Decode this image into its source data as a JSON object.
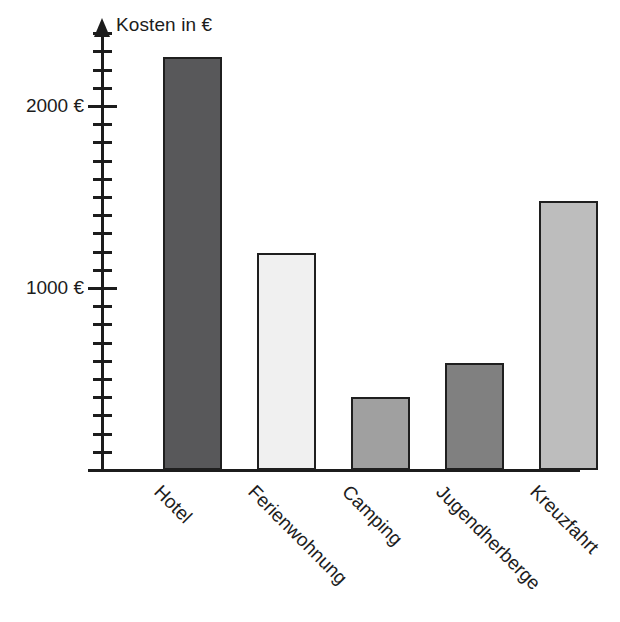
{
  "chart_data": {
    "type": "bar",
    "title": "",
    "ylabel": "Kosten in €",
    "xlabel": "",
    "categories": [
      "Hotel",
      "Ferienwohnung",
      "Camping",
      "Jugendherberge",
      "Kreuzfahrt"
    ],
    "values": [
      2270,
      1190,
      400,
      590,
      1480
    ],
    "unit": "€",
    "ylim": [
      0,
      2400
    ],
    "y_major_ticks": [
      1000,
      2000
    ],
    "y_major_tick_labels": [
      "1000 €",
      "2000 €"
    ],
    "y_minor_tick_interval": 100,
    "grid": false,
    "legend": null,
    "bar_colors": [
      "#58585a",
      "#f0f0f0",
      "#a0a0a0",
      "#808080",
      "#bdbdbd"
    ],
    "bar_border_color": "#1f1f1f",
    "axis_color": "#1c1c1c",
    "category_label_rotation_deg": 45,
    "series": [
      {
        "name": "Kosten",
        "points": [
          {
            "category": "Hotel",
            "value": 2270,
            "color": "#58585a"
          },
          {
            "category": "Ferienwohnung",
            "value": 1190,
            "color": "#f0f0f0"
          },
          {
            "category": "Camping",
            "value": 400,
            "color": "#a0a0a0"
          },
          {
            "category": "Jugendherberge",
            "value": 590,
            "color": "#808080"
          },
          {
            "category": "Kreuzfahrt",
            "value": 1480,
            "color": "#bdbdbd"
          }
        ]
      }
    ]
  }
}
